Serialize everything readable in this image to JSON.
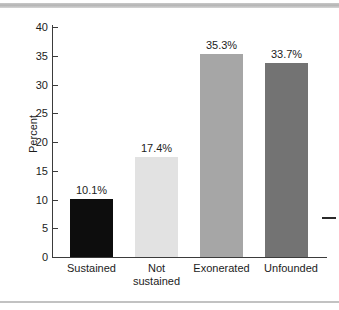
{
  "chart_data": {
    "type": "bar",
    "title": "",
    "subtitle": "",
    "xlabel": "",
    "ylabel": "Percent",
    "ylim": [
      0,
      40
    ],
    "ytick_labels": [
      "40",
      "35",
      "30",
      "25",
      "20",
      "15",
      "10",
      "5",
      "0"
    ],
    "yticks": [
      40,
      35,
      30,
      25,
      20,
      15,
      10,
      5,
      0
    ],
    "grid": false,
    "legend": null,
    "categories": [
      "Sustained",
      "Not sustained",
      "Exonerated",
      "Unfounded"
    ],
    "category_lines": [
      [
        "Sustained"
      ],
      [
        "Not",
        "sustained"
      ],
      [
        "Exonerated"
      ],
      [
        "Unfounded"
      ]
    ],
    "values": [
      10.1,
      17.4,
      35.3,
      33.7
    ],
    "data_labels": [
      "10.1%",
      "17.4%",
      "35.3%",
      "33.7%"
    ],
    "bar_colors": [
      "#0d0d0d",
      "#e2e2e2",
      "#a6a6a6",
      "#737373"
    ]
  },
  "colors": {
    "axis": "#3b3b3b",
    "text": "#1c1c1c",
    "background": "#ffffff",
    "top_band": "#b4b4b4",
    "bottom_rule": "#c2c2c2"
  }
}
